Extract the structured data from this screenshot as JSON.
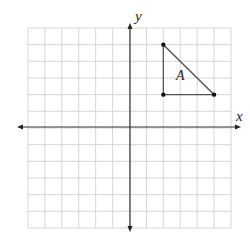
{
  "diagram": {
    "type": "coordinate-plane",
    "grid": {
      "cols": 12,
      "rows": 12,
      "xmin": -6,
      "xmax": 6,
      "ymin": -6,
      "ymax": 6
    },
    "axes": {
      "x_label": "x",
      "y_label": "y"
    },
    "shapes": [
      {
        "name": "A",
        "type": "triangle",
        "vertices": [
          [
            2,
            5
          ],
          [
            2,
            2
          ],
          [
            5,
            2
          ]
        ],
        "label": "A"
      }
    ],
    "colors": {
      "grid": "#d6d6d6",
      "axis": "#333333",
      "shape": "#555555",
      "point": "#111111"
    }
  }
}
